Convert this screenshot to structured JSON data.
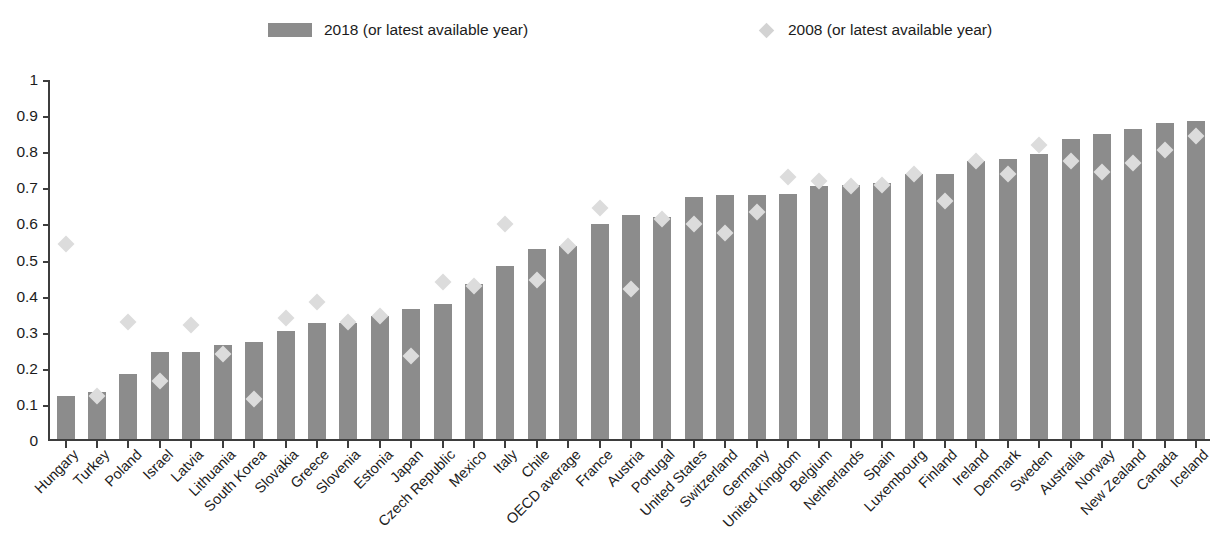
{
  "legend": {
    "items": [
      {
        "label": "2018 (or latest available year)",
        "marker": "bar-swatch",
        "color": "#8c8c8c"
      },
      {
        "label": "2008 (or latest available year)",
        "marker": "diamond-marker",
        "color": "#d3d3d3"
      }
    ]
  },
  "axis": {
    "y_ticks": [
      "0",
      "0.1",
      "0.2",
      "0.3",
      "0.4",
      "0.5",
      "0.6",
      "0.7",
      "0.8",
      "0.9",
      "1"
    ]
  },
  "chart_data": {
    "type": "bar",
    "title": "",
    "xlabel": "",
    "ylabel": "",
    "ylim": [
      0,
      1
    ],
    "grid": false,
    "legend_position": "top",
    "categories": [
      "Hungary",
      "Turkey",
      "Poland",
      "Israel",
      "Latvia",
      "Lithuania",
      "South Korea",
      "Slovakia",
      "Greece",
      "Slovenia",
      "Estonia",
      "Japan",
      "Czech Republic",
      "Mexico",
      "Italy",
      "Chile",
      "OECD average",
      "France",
      "Austria",
      "Portugal",
      "United States",
      "Switzerland",
      "Germany",
      "United Kingdom",
      "Belgium",
      "Netherlands",
      "Spain",
      "Luxembourg",
      "Finland",
      "Ireland",
      "Denmark",
      "Sweden",
      "Australia",
      "Norway",
      "New Zealand",
      "Canada",
      "Iceland"
    ],
    "series": [
      {
        "name": "2018 (or latest available year)",
        "type": "bar",
        "values": [
          0.12,
          0.13,
          0.18,
          0.24,
          0.24,
          0.26,
          0.27,
          0.3,
          0.32,
          0.32,
          0.34,
          0.36,
          0.375,
          0.43,
          0.48,
          0.525,
          0.535,
          0.595,
          0.62,
          0.615,
          0.67,
          0.675,
          0.675,
          0.68,
          0.7,
          0.705,
          0.71,
          0.735,
          0.735,
          0.77,
          0.775,
          0.79,
          0.83,
          0.845,
          0.86,
          0.875,
          0.88
        ]
      },
      {
        "name": "2008 (or latest available year)",
        "type": "scatter",
        "values": [
          0.54,
          0.12,
          0.325,
          0.16,
          0.315,
          0.235,
          0.11,
          0.335,
          0.38,
          0.325,
          0.34,
          0.23,
          0.435,
          0.425,
          0.595,
          0.44,
          0.535,
          0.64,
          0.415,
          0.61,
          0.595,
          0.57,
          0.63,
          0.725,
          0.715,
          0.7,
          0.705,
          0.735,
          0.66,
          0.77,
          0.735,
          0.815,
          0.77,
          0.74,
          0.765,
          0.8,
          0.84
        ]
      }
    ]
  }
}
